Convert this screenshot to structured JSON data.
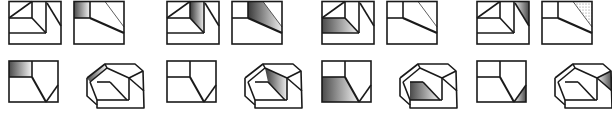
{
  "figure": {
    "stroke_color": "#1a1a1a",
    "shade_color": "#555555",
    "groups": [
      {
        "id": "a",
        "offset_x": 0,
        "shading": "front-view-rectangle"
      },
      {
        "id": "b",
        "offset_x": 158,
        "shading": "sloped-face"
      },
      {
        "id": "c",
        "offset_x": 313,
        "shading": "lower-face"
      },
      {
        "id": "d",
        "offset_x": 468,
        "shading": "corner-triangle"
      }
    ],
    "captions": [
      "",
      "",
      "",
      ""
    ]
  }
}
